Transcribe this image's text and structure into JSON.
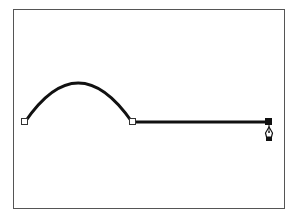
{
  "diagram": {
    "frame": {
      "x": 13.5,
      "y": 9.5,
      "width": 271,
      "height": 199,
      "stroke": "#555555"
    },
    "path": {
      "stroke": "#111111",
      "stroke_width": 3,
      "curve_segment": {
        "start": [
          25,
          122
        ],
        "control": [
          78,
          44
        ],
        "end": [
          132,
          122
        ]
      },
      "line_segment": {
        "start": [
          132,
          122
        ],
        "end": [
          269,
          122
        ]
      }
    },
    "anchors": [
      {
        "id": "anchor-1",
        "x": 25,
        "y": 122,
        "selected": false
      },
      {
        "id": "anchor-2",
        "x": 132,
        "y": 122,
        "selected": false
      },
      {
        "id": "anchor-3",
        "x": 269,
        "y": 122,
        "selected": true
      }
    ],
    "cursor": {
      "type": "pen-tool-icon",
      "x": 269,
      "y": 124
    },
    "colors": {
      "anchor_fill": "#ffffff",
      "anchor_stroke": "#333333",
      "selected_anchor_fill": "#111111"
    }
  }
}
